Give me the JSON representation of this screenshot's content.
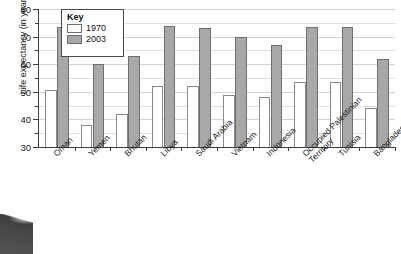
{
  "chart_data": {
    "type": "bar",
    "title": "",
    "xlabel": "",
    "ylabel": "Life expectancy (in years)",
    "ylim": [
      30,
      80
    ],
    "ytick_step": 10,
    "yticks": [
      30,
      40,
      50,
      60,
      70,
      80
    ],
    "minor_tick_step": 5,
    "grid": true,
    "legend_title": "Key",
    "legend_position": "top-left inside plot",
    "categories": [
      "Oman",
      "Yemen",
      "Bhutan",
      "Libya",
      "Saudi Arabia",
      "Vietnam",
      "Indonesia",
      "Occupied Palestinian Territory",
      "Tunisia",
      "Bangladesh"
    ],
    "series": [
      {
        "name": "1970",
        "color": "#ffffff",
        "values": [
          50.5,
          38,
          42,
          52,
          52,
          49,
          48,
          53.5,
          53.5,
          44
        ]
      },
      {
        "name": "2003",
        "color": "#a8a8a8",
        "values": [
          73.5,
          60,
          63,
          74,
          73,
          70,
          67,
          73.5,
          73.5,
          62
        ]
      }
    ]
  },
  "axis": {
    "y_title": "Life expectancy (in years)",
    "y_tick_labels": [
      "30",
      "40",
      "50",
      "60",
      "70",
      "80"
    ]
  },
  "legend": {
    "title": "Key",
    "entries": [
      {
        "label": "1970",
        "swatch": "white"
      },
      {
        "label": "2003",
        "swatch": "gray"
      }
    ]
  },
  "artifact": {
    "name": "scan-edge-artifact"
  }
}
